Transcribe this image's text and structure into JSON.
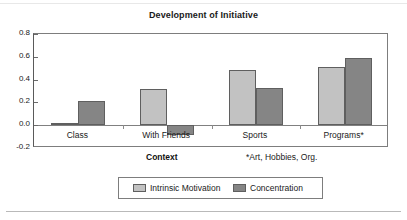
{
  "chart_data": {
    "type": "bar",
    "title": "Development of Initiative",
    "xlabel": "Context",
    "ylabel": "",
    "categories": [
      "Class",
      "With Friends",
      "Sports",
      "Programs*"
    ],
    "series": [
      {
        "name": "Intrinsic Motivation",
        "color": "#c2c2c2",
        "values": [
          0.02,
          0.32,
          0.48,
          0.51
        ]
      },
      {
        "name": "Concentration",
        "color": "#858585",
        "values": [
          0.21,
          -0.09,
          0.33,
          0.59
        ]
      }
    ],
    "ylim": [
      -0.2,
      0.8
    ],
    "yticks": [
      0.8,
      0.6,
      0.4,
      0.2,
      0.0,
      -0.2
    ],
    "ytick_labels": [
      "0.8",
      "0.6",
      "0.4",
      "0.2",
      "0.0",
      "-0.2"
    ],
    "grid": false,
    "legend_position": "bottom",
    "annotations": [
      "*Art, Hobbies, Org."
    ]
  },
  "footnote": "*Art, Hobbies, Org.",
  "legend": {
    "entries": [
      {
        "label": "Intrinsic Motivation"
      },
      {
        "label": "Concentration"
      }
    ]
  }
}
